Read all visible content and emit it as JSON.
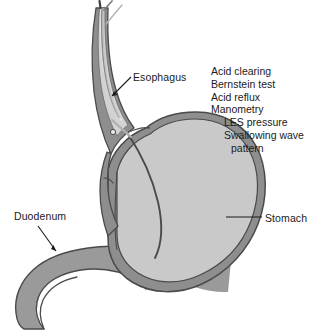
{
  "figure": {
    "background_color": "#ffffff"
  },
  "labels": {
    "esophagus": "Esophagus",
    "duodenum": "Duodenum",
    "stomach": "Stomach"
  },
  "test_list": {
    "lines": [
      {
        "text": "Acid clearing",
        "indent": 0
      },
      {
        "text": "Bernstein test",
        "indent": 0
      },
      {
        "text": "Acid reflux",
        "indent": 0
      },
      {
        "text": "Manometry",
        "indent": 0
      },
      {
        "text": "LES pressure",
        "indent": 1
      },
      {
        "text": "Swallowing wave",
        "indent": 1
      },
      {
        "text": "pattern",
        "indent": 2
      }
    ]
  },
  "colors": {
    "text": "#1a1a1a",
    "leader_line": "#1a1a1a",
    "stomach_lumen": "#c9c9c9",
    "stomach_wall": "#8e8e8e",
    "organ_outline": "#4a4a4a",
    "duodenum_fill": "#9a9a9a",
    "esophagus_wall": "#8e8e8e",
    "esophagus_lumen": "#d2d2d2",
    "catheter_dark": "#3c3c3c",
    "catheter_light": "#a8a8a8"
  },
  "anatomy": {
    "parts": [
      "esophagus",
      "lower-esophageal-sphincter",
      "stomach-body",
      "stomach-fundus",
      "pylorus",
      "duodenum",
      "manometry-catheter"
    ]
  }
}
